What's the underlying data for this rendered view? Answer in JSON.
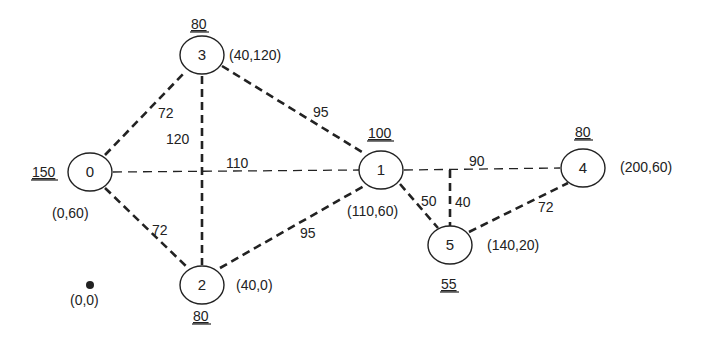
{
  "diagram": {
    "nodes": [
      {
        "id": "0",
        "label": "0",
        "cx": 90,
        "cy": 172,
        "coord": "(0,60)",
        "coord_x": 52,
        "coord_y": 218,
        "demand": "150",
        "demand_x": 32,
        "demand_y": 177
      },
      {
        "id": "1",
        "label": "1",
        "cx": 381,
        "cy": 170,
        "coord": "(110,60)",
        "coord_x": 347,
        "coord_y": 216,
        "demand": "100",
        "demand_x": 368,
        "demand_y": 138
      },
      {
        "id": "2",
        "label": "2",
        "cx": 202,
        "cy": 285,
        "coord": "(40,0)",
        "coord_x": 236,
        "coord_y": 290,
        "demand": "80",
        "demand_x": 193,
        "demand_y": 321
      },
      {
        "id": "3",
        "label": "3",
        "cx": 202,
        "cy": 55,
        "coord": "(40,120)",
        "coord_x": 229,
        "coord_y": 60,
        "demand": "80",
        "demand_x": 191,
        "demand_y": 29
      },
      {
        "id": "4",
        "label": "4",
        "cx": 583,
        "cy": 168,
        "coord": "(200,60)",
        "coord_x": 620,
        "coord_y": 172,
        "demand": "80",
        "demand_x": 575,
        "demand_y": 137
      },
      {
        "id": "5",
        "label": "5",
        "cx": 450,
        "cy": 245,
        "coord": "(140,20)",
        "coord_x": 487,
        "coord_y": 250,
        "demand": "55",
        "demand_x": 441,
        "demand_y": 289
      }
    ],
    "edges": [
      {
        "from": "0",
        "to": "3",
        "weight": "72",
        "x1": 105,
        "y1": 155,
        "x2": 186,
        "y2": 71,
        "label_x": 158,
        "label_y": 118,
        "style": "bold"
      },
      {
        "from": "0",
        "to": "2",
        "weight": "72",
        "x1": 105,
        "y1": 188,
        "x2": 188,
        "y2": 268,
        "label_x": 152,
        "label_y": 235,
        "style": "bold"
      },
      {
        "from": "0",
        "to": "1",
        "weight": "110",
        "x1": 113,
        "y1": 172,
        "x2": 359,
        "y2": 170,
        "label_x": 226,
        "label_y": 168,
        "style": "thin"
      },
      {
        "from": "3",
        "to": "2",
        "weight": "120",
        "x1": 202,
        "y1": 76,
        "x2": 202,
        "y2": 265,
        "label_x": 166,
        "label_y": 144,
        "style": "bold"
      },
      {
        "from": "3",
        "to": "1",
        "weight": "95",
        "x1": 222,
        "y1": 66,
        "x2": 362,
        "y2": 152,
        "label_x": 313,
        "label_y": 117,
        "style": "bold"
      },
      {
        "from": "2",
        "to": "1",
        "weight": "95",
        "x1": 220,
        "y1": 268,
        "x2": 364,
        "y2": 186,
        "label_x": 300,
        "label_y": 238,
        "style": "bold"
      },
      {
        "from": "1",
        "to": "4",
        "weight": "90",
        "x1": 404,
        "y1": 170,
        "x2": 560,
        "y2": 168,
        "label_x": 469,
        "label_y": 166,
        "style": "thin"
      },
      {
        "from": "1",
        "to": "5",
        "weight": "50",
        "x1": 400,
        "y1": 184,
        "x2": 438,
        "y2": 228,
        "label_x": 421,
        "label_y": 206,
        "style": "bold"
      },
      {
        "from": "junction",
        "to": "5",
        "weight": "40",
        "x1": 450,
        "y1": 170,
        "x2": 450,
        "y2": 226,
        "label_x": 455,
        "label_y": 207,
        "style": "bold"
      },
      {
        "from": "5",
        "to": "4",
        "weight": "72",
        "x1": 469,
        "y1": 232,
        "x2": 568,
        "y2": 183,
        "label_x": 538,
        "label_y": 212,
        "style": "bold"
      }
    ],
    "origin": {
      "label": "(0,0)",
      "cx": 90,
      "cy": 285,
      "label_x": 70,
      "label_y": 305
    }
  },
  "colors": {
    "stroke": "#222222",
    "text": "#222222",
    "background": "#ffffff"
  }
}
